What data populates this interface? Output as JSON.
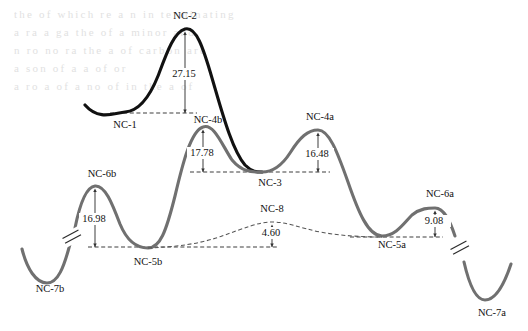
{
  "figure": {
    "type": "reaction-energy-profile",
    "colors": {
      "primary_curve": "#111111",
      "secondary_curve": "#707070",
      "dashed_curve": "#555555",
      "baseline": "#333333",
      "background": "#ffffff"
    }
  },
  "chart_data": {
    "type": "line",
    "title": "",
    "xlabel": "",
    "ylabel": "",
    "grid": false,
    "legend": "none",
    "stationary_points": [
      {
        "id": "NC-1",
        "label": "NC-1",
        "kind": "minimum",
        "curve": "black",
        "x": 125,
        "y": 112,
        "label_x": 125,
        "label_y": 128
      },
      {
        "id": "NC-2",
        "label": "NC-2",
        "kind": "transition-state",
        "curve": "black",
        "x": 185,
        "y": 29,
        "label_x": 185,
        "label_y": 19
      },
      {
        "id": "NC-4b",
        "label": "NC-4b",
        "kind": "transition-state",
        "curve": "gray",
        "x": 203,
        "y": 127,
        "label_x": 208,
        "label_y": 123
      },
      {
        "id": "NC-3",
        "label": "NC-3",
        "kind": "minimum",
        "curve": "gray",
        "x": 262,
        "y": 172,
        "label_x": 270,
        "label_y": 186
      },
      {
        "id": "NC-4a",
        "label": "NC-4a",
        "kind": "transition-state",
        "curve": "gray",
        "x": 318,
        "y": 130,
        "label_x": 320,
        "label_y": 120
      },
      {
        "id": "NC-5a",
        "label": "NC-5a",
        "kind": "minimum",
        "curve": "gray",
        "x": 382,
        "y": 236,
        "label_x": 392,
        "label_y": 248
      },
      {
        "id": "NC-6a",
        "label": "NC-6a",
        "kind": "transition-state",
        "curve": "gray",
        "x": 435,
        "y": 208,
        "label_x": 440,
        "label_y": 197
      },
      {
        "id": "NC-7a",
        "label": "NC-7a",
        "kind": "minimum",
        "curve": "gray",
        "x": 485,
        "y": 295,
        "label_x": 492,
        "label_y": 316
      },
      {
        "id": "NC-7b",
        "label": "NC-7b",
        "kind": "minimum",
        "curve": "gray",
        "x": 47,
        "y": 272,
        "label_x": 50,
        "label_y": 292
      },
      {
        "id": "NC-6b",
        "label": "NC-6b",
        "kind": "transition-state",
        "curve": "gray",
        "x": 95,
        "y": 186,
        "label_x": 102,
        "label_y": 177
      },
      {
        "id": "NC-5b",
        "label": "NC-5b",
        "kind": "minimum",
        "curve": "gray",
        "x": 148,
        "y": 247,
        "label_x": 148,
        "label_y": 265
      },
      {
        "id": "NC-8",
        "label": "NC-8",
        "kind": "transition-state",
        "curve": "dashed",
        "x": 272,
        "y": 222,
        "label_x": 272,
        "label_y": 212
      }
    ],
    "barriers": [
      {
        "value": "27.15",
        "from": "NC-1",
        "to": "NC-2",
        "arrow_x": 185,
        "top_y": 35,
        "bottom_y": 113,
        "label_x": 185,
        "label_y": 77
      },
      {
        "value": "17.78",
        "from": "NC-3",
        "to": "NC-4b",
        "arrow_x": 203,
        "top_y": 133,
        "bottom_y": 172,
        "label_x": 203,
        "label_y": 156
      },
      {
        "value": "16.48",
        "from": "NC-3",
        "to": "NC-4a",
        "arrow_x": 318,
        "top_y": 136,
        "bottom_y": 172,
        "label_x": 318,
        "label_y": 157
      },
      {
        "value": "16.98",
        "from": "NC-5b",
        "to": "NC-6b",
        "arrow_x": 95,
        "top_y": 192,
        "bottom_y": 247,
        "label_x": 95,
        "label_y": 222
      },
      {
        "value": "9.08",
        "from": "NC-5a",
        "to": "NC-6a",
        "arrow_x": 435,
        "top_y": 214,
        "bottom_y": 237,
        "label_x": 435,
        "label_y": 224
      },
      {
        "value": "4.60",
        "from": "NC-5b",
        "to": "NC-8",
        "arrow_x": 272,
        "top_y": 228,
        "bottom_y": 247,
        "label_x": 272,
        "label_y": 236
      }
    ],
    "baselines": [
      {
        "id": "nc1-level",
        "y": 113,
        "x1": 110,
        "x2": 197
      },
      {
        "id": "nc3-level",
        "y": 172,
        "x1": 190,
        "x2": 330
      },
      {
        "id": "nc5b-level",
        "y": 247,
        "x1": 88,
        "x2": 278
      },
      {
        "id": "nc5a-level",
        "y": 237,
        "x1": 350,
        "x2": 443
      }
    ],
    "axis_breaks": [
      {
        "id": "break-left",
        "x": 72,
        "y": 237
      },
      {
        "id": "break-right",
        "x": 460,
        "y": 248
      }
    ]
  },
  "background_bleed": {
    "note": "faint show-through text from reverse side of printed page",
    "lines": [
      "the of which re a n in terminating",
      "a ra a ga the of a minor and",
      "n ro no ra the a of carbon are",
      "a son of a a of or",
      "a ro a of a no of in the a of"
    ]
  }
}
